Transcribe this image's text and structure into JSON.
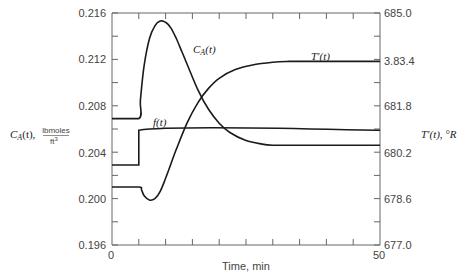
{
  "chart_data": {
    "type": "line",
    "title": "",
    "xlabel": "Time, min",
    "xlim": [
      0,
      50
    ],
    "x_ticks": [
      0,
      5,
      10,
      15,
      20,
      25,
      30,
      35,
      40,
      45,
      50
    ],
    "x_tick_labels": [
      "0",
      "50"
    ],
    "ylabel_left": {
      "main": "C_A(t),",
      "var": "C",
      "sub": "A",
      "arg": "(t),",
      "unit_num": "lbmoles",
      "unit_den": "ft3",
      "unit_den_base": "ft",
      "unit_den_exp": "3"
    },
    "ylim_left": [
      0.196,
      0.216
    ],
    "y_left_tick_labels": [
      "0.216",
      "0.212",
      "0.208",
      "0.204",
      "0.200",
      "0.196"
    ],
    "ylabel_right": "T'(t), °R",
    "ylim_right": [
      677.0,
      685.0
    ],
    "y_right_tick_labels": [
      "685.0",
      "3.83.4",
      "681.8",
      "680.2",
      "678.6",
      "677.0"
    ],
    "grid": false,
    "legend": "inline labels",
    "series": [
      {
        "name": "C_A(t)",
        "label_var": "C",
        "label_sub": "A",
        "label_arg": "(t)",
        "axis": "left",
        "x": [
          0,
          5,
          5.3,
          6,
          7,
          8,
          9,
          10,
          11,
          12,
          13,
          14,
          16,
          18,
          20,
          22,
          25,
          28,
          30,
          33,
          36,
          40,
          45,
          50
        ],
        "values": [
          0.2069,
          0.2069,
          0.2085,
          0.2115,
          0.2138,
          0.2149,
          0.2153,
          0.2152,
          0.2147,
          0.2138,
          0.2127,
          0.2116,
          0.2094,
          0.2077,
          0.2065,
          0.2057,
          0.205,
          0.2047,
          0.2046,
          0.2046,
          0.2046,
          0.2046,
          0.2046,
          0.2046
        ]
      },
      {
        "name": "f(t)",
        "label": "f(t)",
        "axis": "left",
        "x": [
          0,
          5,
          5,
          50
        ],
        "values": [
          0.2029,
          0.2029,
          0.2059,
          0.2059
        ]
      },
      {
        "name": "T'(t)",
        "label": "T'(t)",
        "axis": "right",
        "x": [
          0,
          5,
          5.5,
          6,
          7,
          8,
          9,
          10,
          11,
          12,
          14,
          16,
          18,
          20,
          23,
          26,
          30,
          33,
          36,
          40,
          45,
          50
        ],
        "values": [
          679.0,
          679.0,
          678.9,
          678.7,
          678.55,
          678.6,
          678.85,
          679.3,
          679.8,
          680.3,
          681.2,
          681.9,
          682.4,
          682.75,
          683.05,
          683.2,
          683.3,
          683.33,
          683.33,
          683.33,
          683.33,
          683.33
        ]
      }
    ]
  },
  "labels": {
    "x_zero": "0",
    "x_fifty": "50",
    "x_title": "Time, min",
    "ca_label_var": "C",
    "ca_label_sub": "A",
    "ca_label_arg": "(t)",
    "f_label": "f(t)",
    "t_label": "T'(t)",
    "left_axis_var": "C",
    "left_axis_sub": "A",
    "left_axis_arg": "(t),",
    "left_axis_unit_num": "lbmoles",
    "left_axis_unit_den": "ft",
    "left_axis_unit_exp": "3",
    "right_axis_title": "T'(t), °R",
    "left_ticks": [
      "0.216",
      "0.212",
      "0.208",
      "0.204",
      "0.200",
      "0.196"
    ],
    "right_ticks": [
      "685.0",
      "3.83.4",
      "681.8",
      "680.2",
      "678.6",
      "677.0"
    ]
  },
  "colors": {
    "line": "#1a1a1a",
    "axis": "#555555",
    "text": "#444444"
  }
}
